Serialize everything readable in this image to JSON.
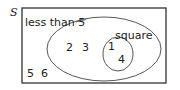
{
  "diagram": {
    "type": "venn",
    "universal_set_label": "S",
    "sets": [
      {
        "label": "less than 5",
        "elements_only_here": [
          "2",
          "3"
        ]
      },
      {
        "label": "square",
        "elements": [
          "1",
          "4"
        ]
      }
    ],
    "outside_elements": [
      "5",
      "6"
    ],
    "regions": {
      "outside": {
        "el1": "5",
        "el2": "6"
      },
      "less_than_5_only": {
        "el1": "2",
        "el2": "3"
      },
      "square": {
        "el1": "1",
        "el2": "4"
      }
    },
    "labels": {
      "universal": "S",
      "less_than_5": "less than 5",
      "square": "square"
    },
    "colors": {
      "stroke": "#333333",
      "text": "#222222",
      "background": "#ffffff"
    }
  }
}
